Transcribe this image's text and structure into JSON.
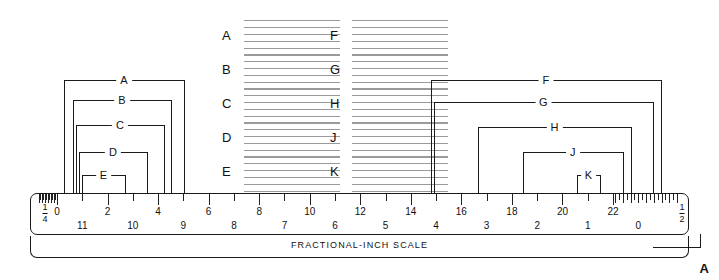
{
  "figure": {
    "title": "FRACTIONAL-INCH SCALE",
    "corner_marker": "A"
  },
  "ruler": {
    "end_left_fraction": {
      "numerator": "1",
      "denominator": "4"
    },
    "end_right_fraction": {
      "numerator": "1",
      "denominator": "2"
    },
    "top_row_numbers": [
      "0",
      "2",
      "4",
      "6",
      "8",
      "10",
      "12",
      "14",
      "16",
      "18",
      "20",
      "22"
    ],
    "bottom_row_numbers": [
      "11",
      "10",
      "9",
      "8",
      "7",
      "6",
      "5",
      "4",
      "3",
      "2",
      "1",
      "0"
    ]
  },
  "dimensions_left": [
    {
      "label": "A"
    },
    {
      "label": "B"
    },
    {
      "label": "C"
    },
    {
      "label": "D"
    },
    {
      "label": "E"
    }
  ],
  "dimensions_right": [
    {
      "label": "F"
    },
    {
      "label": "G"
    },
    {
      "label": "H"
    },
    {
      "label": "J"
    },
    {
      "label": "K"
    }
  ],
  "answers": {
    "column_left": [
      {
        "label": "A"
      },
      {
        "label": "B"
      },
      {
        "label": "C"
      },
      {
        "label": "D"
      },
      {
        "label": "E"
      }
    ],
    "column_right": [
      {
        "label": "F"
      },
      {
        "label": "G"
      },
      {
        "label": "H"
      },
      {
        "label": "J"
      },
      {
        "label": "K"
      }
    ],
    "lines_per_block": 6
  },
  "colors": {
    "ink": "#1a1a1a",
    "rule": "#9a9a9a",
    "paper": "#ffffff"
  }
}
